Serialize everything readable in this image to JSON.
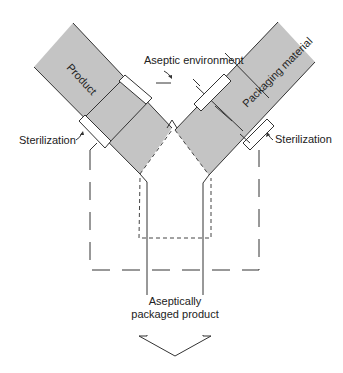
{
  "diagram": {
    "type": "process-flow",
    "labels": {
      "product": "Product",
      "packaging_material": "Packaging material",
      "aseptic_environment": "Aseptic environment",
      "sterilization_left": "Sterilization",
      "sterilization_right": "Sterilization",
      "output_line1": "Aseptically",
      "output_line2": "packaged product"
    },
    "nodes": [
      {
        "id": "product",
        "label": "Product",
        "shape": "diagonal-bar",
        "fill": "#c4c4c4"
      },
      {
        "id": "packaging",
        "label": "Packaging material",
        "shape": "diagonal-bar",
        "fill": "#c4c4c4"
      },
      {
        "id": "aseptic-zone",
        "label": "Aseptic environment",
        "shape": "dashed-boundary"
      },
      {
        "id": "output",
        "label": "Aseptically packaged product",
        "shape": "down-arrow"
      }
    ],
    "edges": [
      {
        "from": "product",
        "to": "output",
        "via": "Sterilization"
      },
      {
        "from": "packaging",
        "to": "output",
        "via": "Sterilization"
      }
    ],
    "colors": {
      "bar_fill": "#c4c4c4",
      "stroke": "#333333",
      "background": "#ffffff"
    }
  }
}
